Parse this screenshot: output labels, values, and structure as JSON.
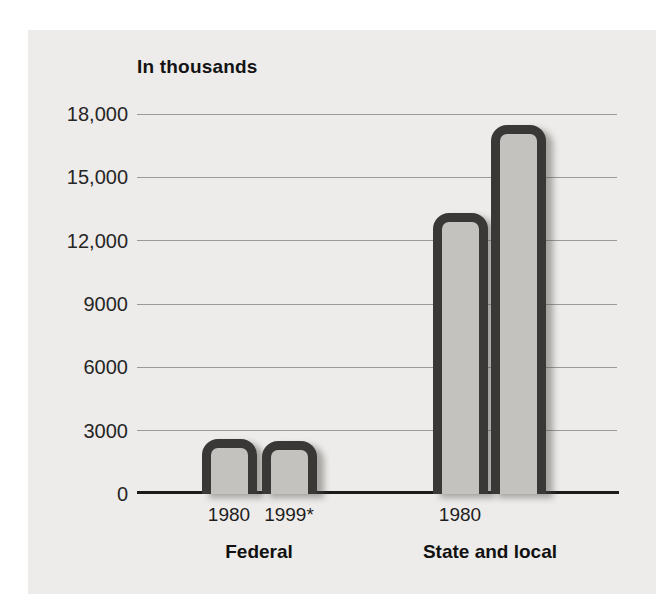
{
  "page": {
    "background": "#ffffff",
    "panel_background": "#eeecea"
  },
  "chart_data": {
    "type": "bar",
    "title": "In thousands",
    "xlabel": "",
    "ylabel": "In thousands",
    "ylim": [
      0,
      18000
    ],
    "grid": true,
    "legend": "none",
    "y_ticks": [
      {
        "value": 18000,
        "label": "18,000"
      },
      {
        "value": 15000,
        "label": "15,000"
      },
      {
        "value": 12000,
        "label": "12,000"
      },
      {
        "value": 9000,
        "label": "9000"
      },
      {
        "value": 6000,
        "label": "6000"
      },
      {
        "value": 3000,
        "label": "3000"
      },
      {
        "value": 0,
        "label": "0"
      }
    ],
    "groups": [
      {
        "label": "Federal",
        "bars": [
          {
            "x_label": "1980",
            "value": 2600
          },
          {
            "x_label": "1999*",
            "value": 2500
          }
        ]
      },
      {
        "label": "State and local",
        "bars": [
          {
            "x_label": "1980",
            "value": 13300
          },
          {
            "x_label": "",
            "value": 17500
          }
        ]
      }
    ],
    "colors": {
      "bar_fill": "#c4c2bf",
      "bar_border": "#3a3836",
      "bar_shadow": "rgba(80,78,74,0.45)",
      "gridline": "#9b9a98",
      "axis": "#1b1b1b",
      "text": "#1e1e1e"
    }
  }
}
